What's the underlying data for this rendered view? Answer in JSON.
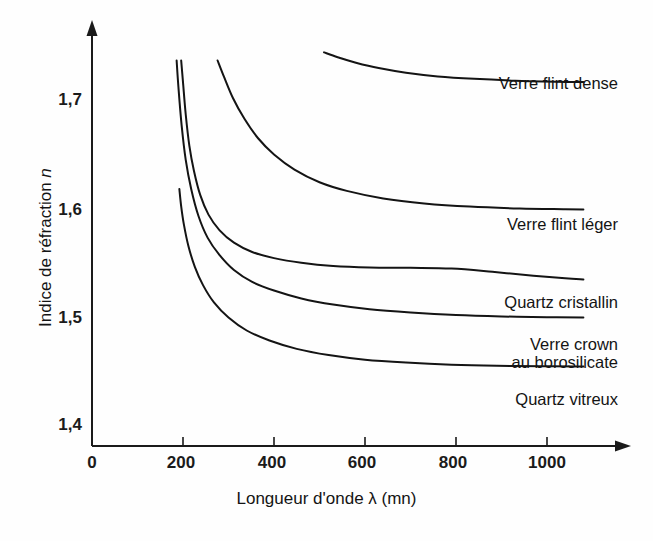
{
  "chart_data": {
    "type": "line",
    "title": "",
    "xlabel": "Longueur d'onde λ (mn)",
    "ylabel": "Indice de réfraction n",
    "xlim": [
      0,
      1180
    ],
    "ylim": [
      1.4,
      1.74
    ],
    "grid": false,
    "legend": "inline-right-of-curve",
    "xticks": [
      0,
      200,
      400,
      600,
      800,
      1000
    ],
    "xtick_labels": [
      "0",
      "200",
      "400",
      "600",
      "800",
      "1000"
    ],
    "yticks": [
      1.4,
      1.5,
      1.6,
      1.7
    ],
    "ytick_labels": [
      "1,4",
      "1,5",
      "1,6",
      "1,7"
    ],
    "line_color": "#141414",
    "line_width": 2.0,
    "series": [
      {
        "name": "Verre flint dense",
        "label": "Verre flint dense",
        "label_x": 600,
        "label_y": 1.719,
        "x": [
          510,
          540,
          580,
          630,
          690,
          760,
          840,
          930,
          1020,
          1080
        ],
        "y": [
          1.745,
          1.7405,
          1.7355,
          1.7305,
          1.7262,
          1.7228,
          1.7205,
          1.7188,
          1.7178,
          1.7175
        ]
      },
      {
        "name": "Verre flint léger",
        "label": "Verre flint léger",
        "label_x": 600,
        "label_y": 1.6,
        "x": [
          276,
          290,
          310,
          335,
          365,
          400,
          445,
          500,
          560,
          640,
          730,
          830,
          940,
          1040,
          1080
        ],
        "y": [
          1.7375,
          1.7225,
          1.7025,
          1.6835,
          1.6655,
          1.6505,
          1.6365,
          1.6248,
          1.6168,
          1.6098,
          1.6052,
          1.6022,
          1.6005,
          1.5998,
          1.5995
        ]
      },
      {
        "name": "Quartz cristallin",
        "label": "Quartz cristallin",
        "label_x": 600,
        "label_y": 1.5345,
        "x": [
          196,
          200,
          206,
          214,
          224,
          238,
          256,
          280,
          312,
          352,
          400,
          460,
          530,
          610,
          700,
          790,
          880,
          970,
          1040,
          1080
        ],
        "y": [
          1.7375,
          1.7175,
          1.6875,
          1.6585,
          1.6355,
          1.6128,
          1.5948,
          1.5805,
          1.5688,
          1.5602,
          1.5545,
          1.5502,
          1.5472,
          1.5458,
          1.5455,
          1.5448,
          1.5418,
          1.5382,
          1.5358,
          1.5348
        ]
      },
      {
        "name": "Verre crown au borosilicate",
        "label_line1": "Verre crown",
        "label_line2": "au borosilicate",
        "label_x": 600,
        "label_y": 1.4855,
        "x": [
          186,
          190,
          197,
          206,
          218,
          234,
          254,
          280,
          312,
          352,
          400,
          460,
          530,
          610,
          700,
          800,
          900,
          1000,
          1080
        ],
        "y": [
          1.7375,
          1.7125,
          1.6775,
          1.6455,
          1.6185,
          1.5935,
          1.5735,
          1.5575,
          1.5435,
          1.5325,
          1.5245,
          1.5172,
          1.5115,
          1.5072,
          1.5042,
          1.5018,
          1.5005,
          1.4998,
          1.4995
        ]
      },
      {
        "name": "Quartz vitreux",
        "label": "Quartz vitreux",
        "label_x": 600,
        "label_y": 1.4365,
        "x": [
          192,
          196,
          202,
          212,
          226,
          244,
          268,
          300,
          340,
          390,
          450,
          520,
          600,
          690,
          790,
          890,
          990,
          1070,
          1080
        ],
        "y": [
          1.6185,
          1.6025,
          1.5855,
          1.5655,
          1.5465,
          1.5295,
          1.5135,
          1.4995,
          1.4875,
          1.4782,
          1.4705,
          1.4648,
          1.4605,
          1.4578,
          1.4558,
          1.4548,
          1.4545,
          1.4542,
          1.4542
        ]
      }
    ]
  },
  "axes": {
    "y_title_prefix": "Indice de réfraction ",
    "y_title_symbol": "n",
    "x_title": "Longueur d'onde λ (mn)"
  }
}
